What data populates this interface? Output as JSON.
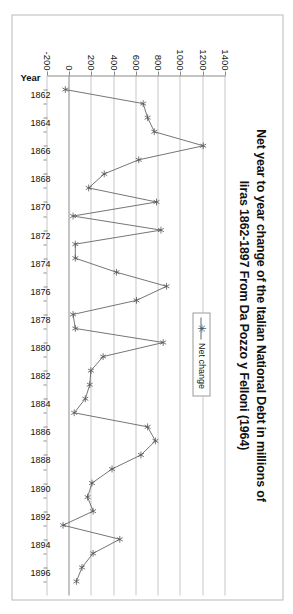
{
  "chart_data": {
    "type": "line",
    "title": "Net year to year change of the Italian National Debt in millions of liras 1862-1897 From Da Pozzo y Felloni (1964)",
    "title_line1": "Net year to year change of the Italian National Debt in millions of",
    "title_line2": "liras 1862-1897 From Da Pozzo y Felloni (1964)",
    "xlabel": "Year",
    "ylabel": "",
    "ylim": [
      -200,
      1400
    ],
    "yticks": [
      1400,
      1200,
      1000,
      800,
      600,
      400,
      200,
      0,
      -200
    ],
    "ytick_labels": [
      "1400",
      "1200",
      "1000",
      "800",
      "600",
      "400",
      "200",
      "0",
      "-200"
    ],
    "grid": true,
    "legend_position": "upper-center",
    "legend": [
      "Net change"
    ],
    "marker": "asterisk",
    "line_color": "#666666",
    "marker_color": "#555555",
    "grid_color": "#c8c8c8",
    "axis_color": "#8a8a8a",
    "xtick_labels": [
      "1862",
      "1864",
      "1866",
      "1868",
      "1870",
      "1872",
      "1874",
      "1876",
      "1878",
      "1880",
      "1882",
      "1884",
      "1886",
      "1888",
      "1890",
      "1892",
      "1894",
      "1896"
    ],
    "x": [
      1862,
      1863,
      1864,
      1865,
      1866,
      1867,
      1868,
      1869,
      1870,
      1871,
      1872,
      1873,
      1874,
      1875,
      1876,
      1877,
      1878,
      1879,
      1880,
      1881,
      1882,
      1883,
      1884,
      1885,
      1886,
      1887,
      1888,
      1889,
      1890,
      1891,
      1892,
      1893,
      1894,
      1895,
      1896,
      1897
    ],
    "series": [
      {
        "name": "Net change",
        "values": [
          -40,
          660,
          700,
          760,
          1200,
          620,
          310,
          170,
          780,
          30,
          820,
          50,
          50,
          420,
          870,
          600,
          30,
          50,
          840,
          300,
          190,
          180,
          140,
          40,
          700,
          770,
          640,
          380,
          200,
          160,
          210,
          -60,
          450,
          210,
          110,
          60
        ]
      }
    ]
  },
  "legend": {
    "label": "Net change",
    "marker_glyph": "✳"
  },
  "axes": {
    "x_title": "Year"
  }
}
